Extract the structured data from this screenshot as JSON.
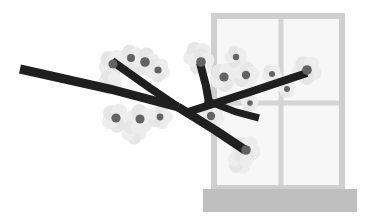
{
  "artwork": {
    "title": "Cherry Blossom Branch in Front of a Window",
    "subject": "sakura-branch-window",
    "style": "flat-grayscale-vector-illustration",
    "canvas": {
      "width": 372,
      "height": 224,
      "background": "#ffffff"
    }
  },
  "palette": {
    "background": "#ffffff",
    "branch": "#1f1f1f",
    "blossom_petal": "#ededed",
    "blossom_petal_alt": "#e6e6e6",
    "blossom_center": "#636363",
    "blossom_center_dark": "#555555",
    "window_frame": "#cfcfcf",
    "window_glass": "#f7f7f7",
    "window_sill": "#bfbfbf",
    "window_mullion": "#d4d4d4"
  },
  "window": {
    "label": "window",
    "outer": {
      "x": 211,
      "y": 13,
      "width": 134,
      "height": 178
    },
    "frame_thickness": 6,
    "glass_fill": "#f7f7f7",
    "frame_color": "#cfcfcf",
    "mullion_vertical_x": 281,
    "mullion_horizontal_y": 103,
    "mullion_thickness": 5,
    "panes": [
      {
        "name": "pane-top-left",
        "x": 217,
        "y": 19,
        "width": 62,
        "height": 82
      },
      {
        "name": "pane-top-right",
        "x": 286,
        "y": 19,
        "width": 53,
        "height": 82
      },
      {
        "name": "pane-bottom-left",
        "x": 217,
        "y": 108,
        "width": 62,
        "height": 77
      },
      {
        "name": "pane-bottom-right",
        "x": 286,
        "y": 108,
        "width": 53,
        "height": 77
      }
    ],
    "sill": {
      "x": 203,
      "y": 189,
      "width": 154,
      "height": 23,
      "color": "#bfbfbf"
    }
  },
  "branches": [
    {
      "name": "branch-main-long",
      "stroke": "#1f1f1f",
      "width": 9,
      "points": [
        [
          20,
          69
        ],
        [
          110,
          89
        ],
        [
          178,
          107
        ]
      ]
    },
    {
      "name": "branch-upper-left-limb",
      "stroke": "#1f1f1f",
      "width": 8,
      "points": [
        [
          112,
          61
        ],
        [
          150,
          88
        ],
        [
          178,
          107
        ]
      ]
    },
    {
      "name": "branch-upper-middle-limb",
      "stroke": "#1f1f1f",
      "width": 8,
      "points": [
        [
          200,
          63
        ],
        [
          206,
          86
        ],
        [
          209,
          103
        ]
      ]
    },
    {
      "name": "branch-lower-right-limb",
      "stroke": "#1f1f1f",
      "width": 9,
      "points": [
        [
          178,
          107
        ],
        [
          215,
          130
        ],
        [
          245,
          150
        ]
      ]
    },
    {
      "name": "branch-cross-right",
      "stroke": "#1f1f1f",
      "width": 8,
      "points": [
        [
          185,
          113
        ],
        [
          250,
          92
        ],
        [
          307,
          73
        ]
      ]
    },
    {
      "name": "branch-short-twig-right",
      "stroke": "#1f1f1f",
      "width": 7,
      "points": [
        [
          205,
          100
        ],
        [
          236,
          112
        ],
        [
          259,
          118
        ]
      ]
    }
  ],
  "blossoms": [
    {
      "name": "blossom-left-upper-1",
      "cx": 113,
      "cy": 64,
      "r": 13,
      "center_r": 4.5,
      "rot": 12
    },
    {
      "name": "blossom-left-upper-2",
      "cx": 131,
      "cy": 58,
      "r": 12,
      "center_r": 4.0,
      "rot": 40
    },
    {
      "name": "blossom-left-upper-3",
      "cx": 145,
      "cy": 62,
      "r": 13,
      "center_r": 4.8,
      "rot": 65
    },
    {
      "name": "blossom-left-upper-4",
      "cx": 158,
      "cy": 70,
      "r": 11,
      "center_r": 3.6,
      "rot": 20
    },
    {
      "name": "blossom-left-mid-1",
      "cx": 110,
      "cy": 82,
      "r": 11,
      "center_r": 0,
      "rot": 30
    },
    {
      "name": "blossom-left-lower-1",
      "cx": 116,
      "cy": 118,
      "r": 13,
      "center_r": 4.6,
      "rot": 8
    },
    {
      "name": "blossom-left-lower-2",
      "cx": 140,
      "cy": 119,
      "r": 13,
      "center_r": 4.5,
      "rot": 48
    },
    {
      "name": "blossom-left-lower-3",
      "cx": 160,
      "cy": 117,
      "r": 11,
      "center_r": 3.4,
      "rot": 70
    },
    {
      "name": "blossom-left-lower-4",
      "cx": 134,
      "cy": 132,
      "r": 11,
      "center_r": 0,
      "rot": 15
    },
    {
      "name": "blossom-center-top-1",
      "cx": 198,
      "cy": 56,
      "r": 13,
      "center_r": 0,
      "rot": 25
    },
    {
      "name": "blossom-center-top-2",
      "cx": 201,
      "cy": 62,
      "r": 12,
      "center_r": 4.8,
      "rot": 55
    },
    {
      "name": "blossom-center-right-1",
      "cx": 224,
      "cy": 77,
      "r": 13,
      "center_r": 4.6,
      "rot": 10
    },
    {
      "name": "blossom-center-right-2",
      "cx": 246,
      "cy": 75,
      "r": 12,
      "center_r": 4.2,
      "rot": 60
    },
    {
      "name": "blossom-center-right-3",
      "cx": 236,
      "cy": 57,
      "r": 10,
      "center_r": 3.2,
      "rot": 35
    },
    {
      "name": "blossom-center-right-4",
      "cx": 272,
      "cy": 74,
      "r": 9,
      "center_r": 3.0,
      "rot": 18
    },
    {
      "name": "blossom-center-bud-1",
      "cx": 287,
      "cy": 89,
      "r": 8,
      "center_r": 3.0,
      "rot": 45
    },
    {
      "name": "blossom-right-tip-1",
      "cx": 307,
      "cy": 70,
      "r": 13,
      "center_r": 4.8,
      "rot": 22
    },
    {
      "name": "blossom-right-bud-2",
      "cx": 250,
      "cy": 103,
      "r": 8,
      "center_r": 2.8,
      "rot": 50
    },
    {
      "name": "blossom-mid-bud-1",
      "cx": 211,
      "cy": 116,
      "r": 12,
      "center_r": 4.2,
      "rot": 30
    },
    {
      "name": "blossom-bottom-tip-1",
      "cx": 246,
      "cy": 150,
      "r": 13,
      "center_r": 4.8,
      "rot": 14
    },
    {
      "name": "blossom-bottom-tip-2",
      "cx": 240,
      "cy": 162,
      "r": 11,
      "center_r": 0,
      "rot": 62
    }
  ]
}
